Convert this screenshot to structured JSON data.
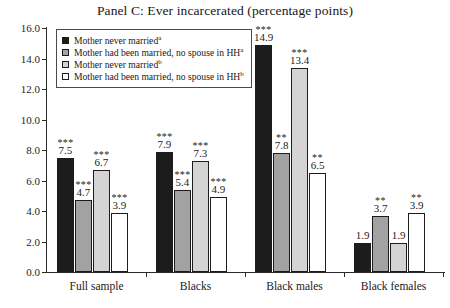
{
  "chart_data": {
    "type": "bar",
    "title": "Panel C: Ever incarcerated (percentage points)",
    "xlabel": "",
    "ylabel": "",
    "ylim": [
      0.0,
      16.0
    ],
    "ytick_step": 2.0,
    "yticks": [
      "16.0",
      "14.0",
      "12.0",
      "10.0",
      "8.0",
      "6.0",
      "4.0",
      "2.0",
      "0.0"
    ],
    "grid": false,
    "legend_position": "top-left-inside",
    "categories": [
      "Full sample",
      "Blacks",
      "Black males",
      "Black females"
    ],
    "series": [
      {
        "name": "Mother never married",
        "superscript": "a",
        "color": "#1c1c1c",
        "values": [
          7.5,
          7.9,
          14.9,
          1.9
        ],
        "significance": [
          "***",
          "***",
          "***",
          ""
        ]
      },
      {
        "name": "Mother had been married, no spouse in HH",
        "superscript": "a",
        "color": "#a2a2a2",
        "values": [
          4.7,
          5.4,
          7.8,
          3.7
        ],
        "significance": [
          "***",
          "***",
          "**",
          "**"
        ]
      },
      {
        "name": "Mother never married",
        "superscript": "b",
        "color": "#d4d4d4",
        "values": [
          6.7,
          7.3,
          13.4,
          1.9
        ],
        "significance": [
          "***",
          "***",
          "***",
          ""
        ]
      },
      {
        "name": "Mother had been married, no spouse in HH",
        "superscript": "b",
        "color": "#ffffff",
        "values": [
          3.9,
          4.9,
          6.5,
          3.9
        ],
        "significance": [
          "***",
          "***",
          "**",
          "**"
        ]
      }
    ]
  }
}
